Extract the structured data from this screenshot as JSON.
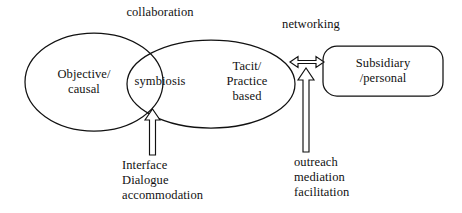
{
  "diagram": {
    "labels": {
      "collaboration": "collaboration",
      "networking": "networking",
      "objective_causal": "Objective/\ncausal",
      "symbiosis": "symbiosis",
      "tacit_practice_based": "Tacit/\nPractice\nbased",
      "subsidiary_personal": "Subsidiary\n/personal",
      "interface_dialogue_accommodation": "Interface\nDialogue\naccommodation",
      "outreach_mediation_facilitation": "outreach\nmediation\nfacilitation"
    },
    "colors": {
      "stroke": "#111111",
      "background": "#ffffff",
      "text": "#111111"
    }
  }
}
